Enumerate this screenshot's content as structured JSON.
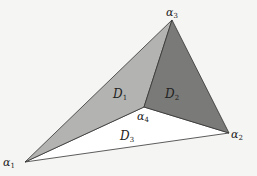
{
  "diagram": {
    "vertices": [
      {
        "id": "a1",
        "label": "α",
        "sub": "1",
        "x": 25,
        "y": 162,
        "lx": 3,
        "ly": 166
      },
      {
        "id": "a2",
        "label": "α",
        "sub": "2",
        "x": 229,
        "y": 133,
        "lx": 231,
        "ly": 138
      },
      {
        "id": "a3",
        "label": "α",
        "sub": "3",
        "x": 172,
        "y": 20,
        "lx": 166,
        "ly": 16
      },
      {
        "id": "a4",
        "label": "α",
        "sub": "4",
        "x": 144,
        "y": 107,
        "lx": 137,
        "ly": 120
      }
    ],
    "regions": [
      {
        "id": "D1",
        "label": "D",
        "sub": "1",
        "fill": "#b3b3b1",
        "lx": 113,
        "ly": 98
      },
      {
        "id": "D2",
        "label": "D",
        "sub": "2",
        "fill": "#7a7a78",
        "lx": 165,
        "ly": 98
      },
      {
        "id": "D3",
        "label": "D",
        "sub": "3",
        "fill": "#ffffff",
        "lx": 120,
        "ly": 140
      }
    ]
  }
}
